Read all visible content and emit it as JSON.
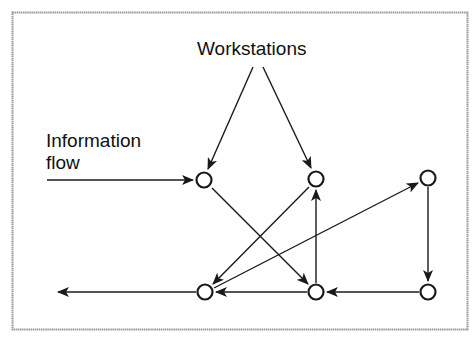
{
  "diagram": {
    "frame": {
      "x": 12,
      "y": 12,
      "width": 456,
      "height": 318,
      "color": "#9a9a9a"
    },
    "labels": {
      "workstations": "Workstations",
      "information_flow_line1": "Information",
      "information_flow_line2": "flow"
    },
    "colors": {
      "stroke": "#1a1a1a",
      "node_fill": "#ffffff",
      "frame": "#9a9a9a"
    },
    "nodes": [
      {
        "id": "A",
        "x": 204,
        "y": 180
      },
      {
        "id": "B",
        "x": 316,
        "y": 179
      },
      {
        "id": "C",
        "x": 428,
        "y": 178
      },
      {
        "id": "D",
        "x": 205,
        "y": 292
      },
      {
        "id": "E",
        "x": 316,
        "y": 292
      },
      {
        "id": "F",
        "x": 428,
        "y": 292
      }
    ],
    "edges": [
      {
        "from": "Workstations-label",
        "to": "A"
      },
      {
        "from": "Workstations-label",
        "to": "B"
      },
      {
        "from": "Information-flow-input",
        "to": "A"
      },
      {
        "from": "A",
        "to": "E"
      },
      {
        "from": "B",
        "to": "D"
      },
      {
        "from": "E",
        "to": "B"
      },
      {
        "from": "D",
        "to": "C"
      },
      {
        "from": "C",
        "to": "F"
      },
      {
        "from": "F",
        "to": "E"
      },
      {
        "from": "E",
        "to": "D"
      },
      {
        "from": "D",
        "to": "output"
      }
    ]
  }
}
